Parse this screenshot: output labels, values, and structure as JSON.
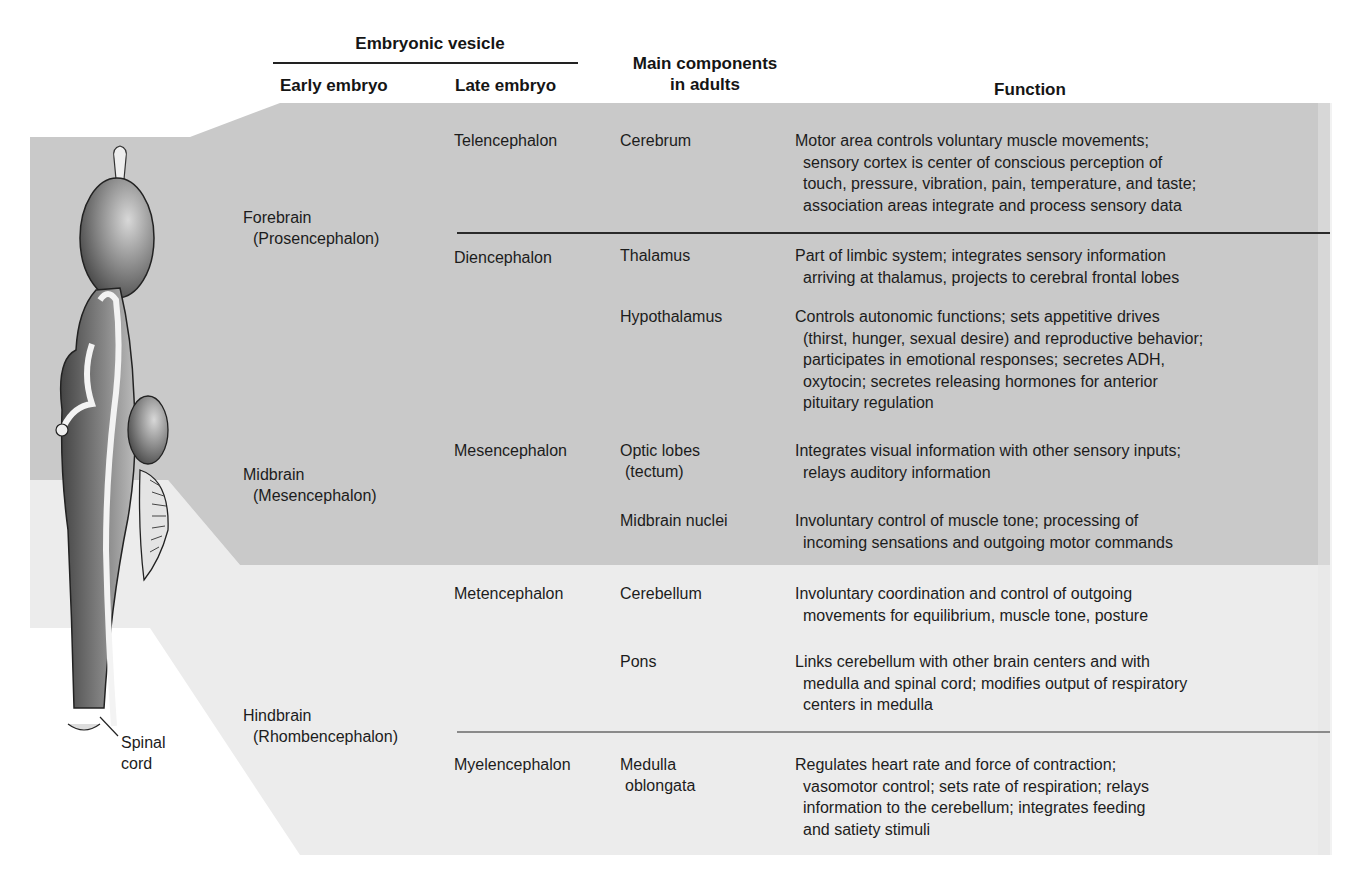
{
  "header": {
    "embryonic_vesicle": "Embryonic vesicle",
    "early_embryo": "Early embryo",
    "late_embryo": "Late embryo",
    "main_components_line1": "Main components",
    "main_components_line2": "in adults",
    "function": "Function"
  },
  "colors": {
    "dark_band": "#c9c9c9",
    "light_band": "#ececec",
    "paper": "#ffffff",
    "rule_dark": "#2a2a2a",
    "rule_light": "#8a8a8a",
    "text": "#1c1c1c"
  },
  "early_embryo": [
    {
      "name": "Forebrain",
      "alt": "(Prosencephalon)"
    },
    {
      "name": "Midbrain",
      "alt": "(Mesencephalon)"
    },
    {
      "name": "Hindbrain",
      "alt": "(Rhombencephalon)"
    }
  ],
  "late_embryo": [
    "Telencephalon",
    "Diencephalon",
    "Mesencephalon",
    "Metencephalon",
    "Myelencephalon"
  ],
  "components": [
    {
      "name": [
        "Cerebrum"
      ]
    },
    {
      "name": [
        "Thalamus"
      ]
    },
    {
      "name": [
        "Hypothalamus"
      ]
    },
    {
      "name": [
        "Optic lobes",
        "(tectum)"
      ]
    },
    {
      "name": [
        "Midbrain nuclei"
      ]
    },
    {
      "name": [
        "Cerebellum"
      ]
    },
    {
      "name": [
        "Pons"
      ]
    },
    {
      "name": [
        "Medulla",
        "oblongata"
      ]
    }
  ],
  "functions": [
    [
      "Motor area controls voluntary muscle movements;",
      "sensory cortex is center of conscious perception of",
      "touch, pressure, vibration, pain, temperature, and taste;",
      "association areas integrate and process sensory data"
    ],
    [
      "Part of limbic system; integrates sensory information",
      "arriving at thalamus, projects to cerebral frontal lobes"
    ],
    [
      "Controls autonomic functions; sets appetitive drives",
      "(thirst, hunger, sexual desire) and reproductive behavior;",
      "participates in emotional responses; secretes ADH,",
      "oxytocin; secretes releasing hormones for anterior",
      "pituitary regulation"
    ],
    [
      "Integrates visual information with other sensory inputs;",
      "relays auditory information"
    ],
    [
      "Involuntary control of muscle tone; processing of",
      "incoming sensations and outgoing motor commands"
    ],
    [
      "Involuntary coordination and control of outgoing",
      "movements for equilibrium, muscle tone, posture"
    ],
    [
      "Links cerebellum with other brain centers and with",
      "medulla and spinal cord; modifies output of respiratory",
      "centers in medulla"
    ],
    [
      "Regulates heart rate and force of contraction;",
      "vasomotor control; sets rate of respiration; relays",
      "information to the cerebellum; integrates feeding",
      "and satiety stimuli"
    ]
  ],
  "illustration": {
    "label_line1": "Spinal",
    "label_line2": "cord"
  }
}
